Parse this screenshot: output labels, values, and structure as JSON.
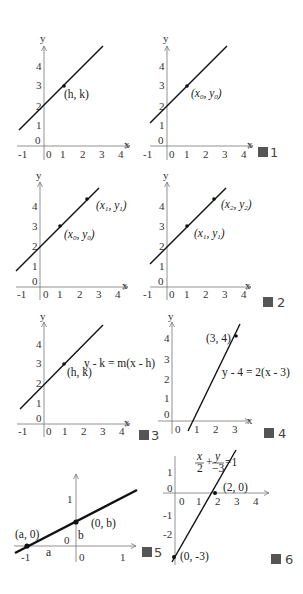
{
  "figures": [
    {
      "id": "fig1a",
      "caption": "",
      "axis": {
        "x": "x",
        "y": "y"
      },
      "xticks": [
        "-1",
        "0",
        "1",
        "2",
        "3",
        "4"
      ],
      "yticks": [
        "0",
        "1",
        "2",
        "3",
        "4"
      ],
      "points": [
        {
          "label": "(h, k)"
        }
      ]
    },
    {
      "id": "fig1b",
      "caption": "圖 1",
      "axis": {
        "x": "x",
        "y": "y"
      },
      "xticks": [
        "-1",
        "0",
        "1",
        "2",
        "3",
        "4"
      ],
      "yticks": [
        "0",
        "1",
        "2",
        "3",
        "4"
      ],
      "points": [
        {
          "label": "(x0, y0)",
          "x": "x",
          "xs": "0",
          "y": "y",
          "ys": "0"
        }
      ]
    },
    {
      "id": "fig2a",
      "caption": "",
      "axis": {
        "x": "x",
        "y": "y"
      },
      "xticks": [
        "-1",
        "0",
        "1",
        "2",
        "3",
        "4"
      ],
      "yticks": [
        "0",
        "1",
        "2",
        "3",
        "4"
      ],
      "points": [
        {
          "x": "x",
          "xs": "1",
          "y": "y",
          "ys": "1"
        },
        {
          "x": "x",
          "xs": "0",
          "y": "y",
          "ys": "0"
        }
      ]
    },
    {
      "id": "fig2b",
      "caption": "圖 2",
      "axis": {
        "x": "x",
        "y": "y"
      },
      "xticks": [
        "-1",
        "0",
        "1",
        "2",
        "3",
        "4"
      ],
      "yticks": [
        "0",
        "1",
        "2",
        "3",
        "4"
      ],
      "points": [
        {
          "x": "x",
          "xs": "2",
          "y": "y",
          "ys": "2"
        },
        {
          "x": "x",
          "xs": "1",
          "y": "y",
          "ys": "1"
        }
      ]
    },
    {
      "id": "fig3",
      "caption": "圖 3",
      "axis": {
        "x": "x",
        "y": "y"
      },
      "xticks": [
        "-1",
        "0",
        "1",
        "2",
        "3",
        "4"
      ],
      "yticks": [
        "0",
        "1",
        "2",
        "3",
        "4"
      ],
      "points": [
        {
          "label": "(h, k)"
        }
      ],
      "equation": "y - k = m(x - h)"
    },
    {
      "id": "fig4",
      "caption": "圖 4",
      "axis": {
        "x": "x",
        "y": "y"
      },
      "xticks": [
        "0",
        "1",
        "2",
        "3"
      ],
      "yticks": [
        "0",
        "1",
        "2",
        "3",
        "4"
      ],
      "points": [
        {
          "label": "(3, 4)"
        }
      ],
      "equation": "y - 4 = 2(x - 3)"
    },
    {
      "id": "fig5",
      "caption": "圖 5",
      "xticks": [
        "-1",
        "0",
        "1"
      ],
      "yticks": [
        "0",
        "1"
      ],
      "points": [
        {
          "label": "(a, 0)"
        },
        {
          "label": "(0, b)"
        }
      ],
      "segments": {
        "a": "a",
        "b": "b"
      }
    },
    {
      "id": "fig6",
      "caption": "圖 6",
      "xticks": [
        "0",
        "1",
        "2",
        "3",
        "4"
      ],
      "yticks": [
        "1",
        "0",
        "-1",
        "-2"
      ],
      "points": [
        {
          "label": "(2, 0)"
        },
        {
          "label": "(0, -3)"
        }
      ],
      "equation": {
        "x_num": "x",
        "x_den": "2",
        "plus": "+",
        "y_num": "y",
        "y_den": "−3",
        "rhs": "=1"
      }
    }
  ]
}
